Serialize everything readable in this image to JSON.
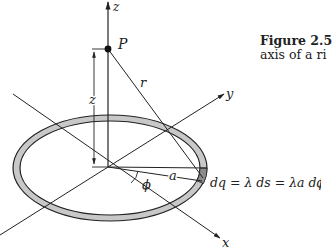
{
  "figure": {
    "caption_title": "Figure 2.5",
    "caption_text": "axis of a ri",
    "labels": {
      "z_axis": "z",
      "y_axis": "y",
      "x_axis": "x",
      "point": "P",
      "distance_r": "r",
      "height_z": "z",
      "radius_a": "a",
      "angle_phi": "ϕ",
      "charge_element": "dq = λ ds = λa dϕ"
    },
    "colors": {
      "line": "#222222",
      "ring_fill": "#c8c8c8",
      "segment_fill": "#8c8c8c"
    }
  }
}
